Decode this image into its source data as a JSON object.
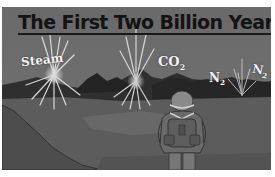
{
  "figure": {
    "title": "The First Two Billion Years",
    "labels": {
      "steam": "Steam",
      "co2_base": "CO",
      "co2_sub": "2",
      "n2a_base": "N",
      "n2a_sub": "2",
      "n2b_base": "N",
      "n2b_sub": "2"
    },
    "elements": {
      "sky": "dark gray sky",
      "mountains": "dark mountain range",
      "gas_bursts": [
        "steam-burst",
        "co2-burst",
        "n2-burst"
      ],
      "figure": "explorer viewed from behind with helmet and backpack"
    },
    "colors": {
      "sky": "#6e6e6e",
      "mountains": "#2e2e2e",
      "ground": "#5a5a5a",
      "title_text": "#141414",
      "label_text": "#f2f2f2"
    }
  }
}
